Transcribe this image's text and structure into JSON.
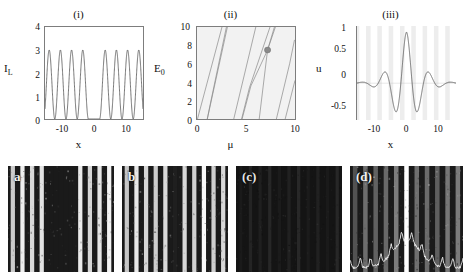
{
  "figure": {
    "panels_top": [
      {
        "title": "(i)",
        "ylabel": "I",
        "ylabel_sub": "L",
        "xlabel": "x",
        "yticks": [
          "0",
          "1",
          "2",
          "3",
          "4"
        ],
        "xticks": [
          "-10",
          "0",
          "10"
        ]
      },
      {
        "title": "(ii)",
        "ylabel": "E",
        "ylabel_sub": "0",
        "xlabel": "μ",
        "yticks": [
          "0",
          "2",
          "4",
          "6",
          "8",
          "10"
        ],
        "xticks": [
          "0",
          "5",
          "10"
        ]
      },
      {
        "title": "(iii)",
        "ylabel": "u",
        "ylabel_sub": "",
        "xlabel": "x",
        "yticks": [
          "-0.5",
          "0",
          "0.5",
          "1"
        ],
        "xticks": [
          "-10",
          "0",
          "10"
        ]
      }
    ],
    "panels_bottom": [
      {
        "label": "a"
      },
      {
        "label": "b"
      },
      {
        "label": "(c)"
      },
      {
        "label": "(d)"
      }
    ]
  },
  "chart_data": [
    {
      "type": "line",
      "title": "(i)",
      "xlabel": "x",
      "ylabel": "I_L",
      "xlim": [
        -14,
        14
      ],
      "ylim": [
        0,
        4
      ],
      "xticks": [
        -10,
        0,
        10
      ],
      "yticks": [
        0,
        1,
        2,
        3,
        4
      ],
      "grid": false,
      "description": "Periodic optical lattice intensity with a central defect: cos^2-like fringes of amplitude 3 and period about 3.2 in x, interrupted by a flat zero-intensity gap spanning roughly -1.6 to 1.6.",
      "series": [
        {
          "name": "lattice intensity",
          "color": "#4d4d4d",
          "peak_value": 3.0,
          "baseline_value": 0.0,
          "period": 3.2,
          "gap_range": [
            -1.6,
            1.6
          ],
          "peak_positions": [
            -12.8,
            -9.6,
            -6.4,
            -3.2,
            3.2,
            6.4,
            9.6,
            12.8
          ]
        }
      ]
    },
    {
      "type": "line",
      "title": "(ii)",
      "xlabel": "μ",
      "ylabel": "E_0",
      "xlim": [
        0,
        10
      ],
      "ylim": [
        0,
        10
      ],
      "xticks": [
        0,
        5,
        10
      ],
      "yticks": [
        0,
        2,
        4,
        6,
        8,
        10
      ],
      "grid": false,
      "background": "#f2f2f2",
      "description": "Band-gap / propagation-constant diagram: families of steep nearly straight branches of defect-mode curves rising from the mu axis, with one highlighted operating point marked by a filled circle.",
      "annotations": [
        {
          "type": "marker",
          "x": 7.2,
          "y": 7.5,
          "shape": "circle",
          "color": "#8a8a8a",
          "radius": 0.32
        }
      ],
      "series": [
        {
          "name": "branch-1",
          "color": "#8a8a8a",
          "points": [
            [
              0.05,
              0.0
            ],
            [
              2.55,
              10.0
            ]
          ]
        },
        {
          "name": "branch-2",
          "color": "#8a8a8a",
          "points": [
            [
              1.05,
              0.0
            ],
            [
              3.1,
              10.0
            ]
          ]
        },
        {
          "name": "branch-2b",
          "color": "#8a8a8a",
          "points": [
            [
              1.05,
              0.0
            ],
            [
              1.35,
              1.6
            ],
            [
              3.0,
              10.0
            ]
          ]
        },
        {
          "name": "branch-3",
          "color": "#8a8a8a",
          "points": [
            [
              3.75,
              0.0
            ],
            [
              6.0,
              10.0
            ]
          ]
        },
        {
          "name": "branch-4",
          "color": "#8a8a8a",
          "points": [
            [
              4.55,
              0.0
            ],
            [
              5.35,
              3.4
            ],
            [
              7.45,
              10.0
            ]
          ]
        },
        {
          "name": "branch-4b",
          "color": "#8a8a8a",
          "points": [
            [
              4.6,
              0.0
            ],
            [
              5.5,
              3.6
            ],
            [
              7.2,
              7.5
            ],
            [
              7.9,
              10.0
            ]
          ]
        },
        {
          "name": "branch-5",
          "color": "#8a8a8a",
          "points": [
            [
              6.35,
              0.0
            ],
            [
              7.2,
              7.5
            ],
            [
              8.0,
              10.0
            ]
          ]
        },
        {
          "name": "branch-6",
          "color": "#8a8a8a",
          "points": [
            [
              8.1,
              0.0
            ],
            [
              9.45,
              6.0
            ],
            [
              9.95,
              8.6
            ]
          ]
        },
        {
          "name": "branch-7",
          "color": "#8a8a8a",
          "points": [
            [
              9.0,
              0.0
            ],
            [
              10.0,
              4.2
            ]
          ]
        }
      ]
    },
    {
      "type": "line",
      "title": "(iii)",
      "xlabel": "x",
      "ylabel": "u",
      "xlim": [
        -14,
        14
      ],
      "ylim": [
        -0.72,
        1.12
      ],
      "xticks": [
        -10,
        0,
        10
      ],
      "yticks": [
        -0.5,
        0,
        0.5,
        1
      ],
      "grid": false,
      "description": "Localized gap-soliton profile u(x): central peak of amplitude 1 at x=0, flanked by negative side lobes near -0.38 and decaying oscillatory tails; faint vertical grey stripes in the background mark the underlying lattice period.",
      "series": [
        {
          "name": "gap soliton u(x)",
          "color": "#4d4d4d",
          "peak_value": 1.0,
          "first_minimum": -0.38,
          "envelope_decay": "exponential",
          "oscillation_period": 3.2
        }
      ],
      "background_stripes": {
        "color": "#ededed",
        "period": 3.2
      }
    },
    {
      "type": "image",
      "title": "experimental CCD output images",
      "panels": [
        {
          "label": "a",
          "description": "Regular vertical interference fringes with a broad dark defect region near the centre."
        },
        {
          "label": "b",
          "description": "Vertical fringes with a dark central channel and scattered speckle in the defect."
        },
        {
          "label": "(c)",
          "description": "Almost uniformly dark frame with very faint residual vertical structure."
        },
        {
          "label": "(d)",
          "description": "Vertical fringes with a bright localized central stripe plus an overlaid white intensity line-trace along the bottom."
        }
      ]
    }
  ]
}
